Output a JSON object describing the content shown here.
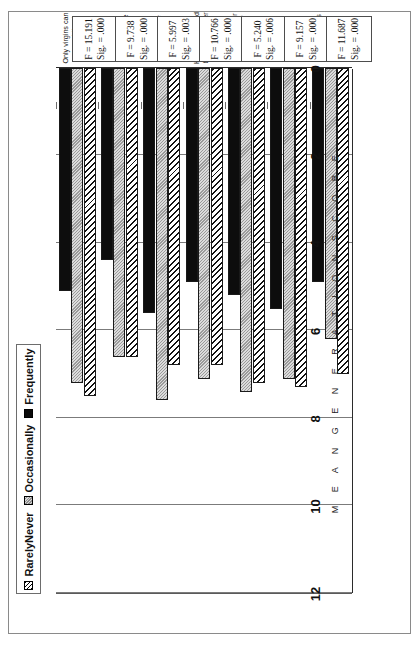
{
  "legend": {
    "items": [
      {
        "label": "RarelyNever",
        "swatch": "hatch-diagonal-swatch",
        "color": "#ffffff"
      },
      {
        "label": "Occasionally",
        "swatch": "gray-dotted-swatch",
        "color": "#c2c2c2"
      },
      {
        "label": "Frequently",
        "swatch": "black-solid-swatch",
        "color": "#0d0d0d"
      }
    ]
  },
  "axis": {
    "title": "M E A N   G E N E R A T I O N   S C O R E",
    "ticks": [
      "12",
      "10",
      "8",
      "6",
      "4",
      "2",
      "0"
    ]
  },
  "chart_data": {
    "type": "bar",
    "orientation": "horizontal",
    "title": "",
    "xlabel": "MEAN GENERATION SCORE",
    "ylabel": "",
    "xlim": [
      0,
      12
    ],
    "grid": true,
    "legend_position": "top",
    "categories": [
      "Only virgins can wear white at weddings",
      "Teen girls shouldn't call boys on phone",
      "Quinceaneras for girls at age 15",
      "Husband should be sole provider",
      "Husband/father is in charge of home",
      "Young single women need permission to go out",
      "Oldest son has authority if father is gone"
    ],
    "series": [
      {
        "name": "RarelyNever",
        "values": [
          7.5,
          6.6,
          6.8,
          6.8,
          7.2,
          7.3,
          7.0
        ]
      },
      {
        "name": "Occasionally",
        "values": [
          7.2,
          6.6,
          7.6,
          7.1,
          7.4,
          7.1,
          6.2
        ]
      },
      {
        "name": "Frequently",
        "values": [
          5.1,
          4.4,
          5.6,
          4.9,
          5.2,
          5.5,
          4.9
        ]
      }
    ],
    "annotations": [
      {
        "category": "Only virgins can wear white at weddings",
        "F": "F = 15.191",
        "Sig": "Sig. = .000"
      },
      {
        "category": "Teen girls shouldn't call boys on phone",
        "F": "F = 9.738",
        "Sig": "Sig. = .000"
      },
      {
        "category": "Quinceaneras for girls at age 15",
        "F": "F = 5.997",
        "Sig": "Sig. = .003"
      },
      {
        "category": "Husband should be sole provider",
        "F": "F = 10.766",
        "Sig": "Sig. = .000"
      },
      {
        "category": "Husband/father is in charge of home",
        "F": "F = 5.240",
        "Sig": "Sig. = .006"
      },
      {
        "category": "Young single women need permission to go out",
        "F": "F = 9.157",
        "Sig": "Sig. = .000"
      },
      {
        "category": "Oldest son has authority if father is gone",
        "F": "F = 11.687",
        "Sig": "Sig. = .000"
      }
    ]
  }
}
